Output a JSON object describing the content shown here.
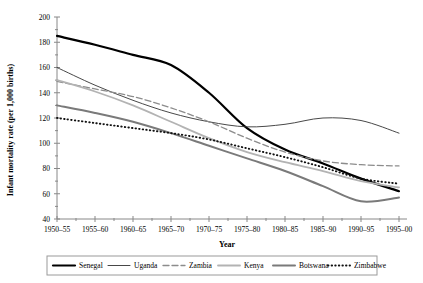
{
  "chart_data": {
    "type": "line",
    "title": "",
    "xlabel": "Year",
    "ylabel": "Infant mortality rate (per 1,000 births)",
    "categories": [
      "1950–55",
      "1955–60",
      "1960–65",
      "1965–70",
      "1970–75",
      "1975–80",
      "1980–85",
      "1985–90",
      "1990–95",
      "1995–00"
    ],
    "ylim": [
      40,
      200
    ],
    "ytick_values": [
      40,
      60,
      80,
      100,
      120,
      140,
      160,
      180,
      200
    ],
    "grid": false,
    "legend_position": "bottom",
    "series": [
      {
        "name": "Senegal",
        "style": "solid-thick-black",
        "color": "#000000",
        "values": [
          185,
          178,
          170,
          162,
          140,
          112,
          95,
          84,
          72,
          62
        ]
      },
      {
        "name": "Uganda",
        "style": "solid-thin-black",
        "color": "#333333",
        "values": [
          160,
          146,
          134,
          124,
          117,
          113,
          115,
          120,
          118,
          108
        ]
      },
      {
        "name": "Zambia",
        "style": "dashed-gray",
        "color": "#8c8c8c",
        "values": [
          149,
          143,
          137,
          128,
          117,
          104,
          93,
          86,
          83,
          82
        ]
      },
      {
        "name": "Kenya",
        "style": "solid-lightgray",
        "color": "#b3b3b3",
        "values": [
          150,
          141,
          130,
          117,
          104,
          93,
          85,
          78,
          70,
          65
        ]
      },
      {
        "name": "Botswana",
        "style": "solid-thick-gray",
        "color": "#7a7a7a",
        "values": [
          130,
          124,
          117,
          108,
          98,
          88,
          78,
          66,
          54,
          57
        ]
      },
      {
        "name": "Zimbabwe",
        "style": "dotted-black",
        "color": "#111111",
        "values": [
          120,
          116,
          112,
          108,
          103,
          96,
          89,
          81,
          72,
          68
        ]
      }
    ]
  },
  "axes": {
    "x_axis_title": "Year",
    "y_axis_title": "Infant mortality rate (per 1,000 births)",
    "y_ticks": [
      "200",
      "180",
      "160",
      "140",
      "120",
      "100",
      "80",
      "60",
      "40"
    ],
    "x_ticks": [
      "1950–55",
      "1955–60",
      "1960–65",
      "1965–70",
      "1970–75",
      "1975–80",
      "1980–85",
      "1985–90",
      "1990–95",
      "1995–00"
    ]
  },
  "legend": {
    "entries": [
      {
        "label": "Senegal"
      },
      {
        "label": "Uganda"
      },
      {
        "label": "Zambia"
      },
      {
        "label": "Kenya"
      },
      {
        "label": "Botswana"
      },
      {
        "label": "Zimbabwe"
      }
    ]
  }
}
